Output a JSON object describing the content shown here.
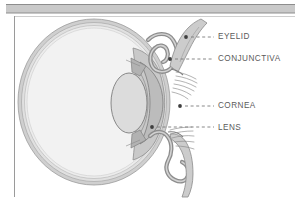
{
  "figure": {
    "background_color": "#ffffff",
    "frame": {
      "top_band_color": "#c9c9c9",
      "top_band_rule_color": "#8f8f8f",
      "left_rule_color": "#9a9a9a"
    }
  },
  "palette": {
    "outline": "#6e6e6e",
    "sclera_outer": "#bdbdbd",
    "sclera_mid": "#d6d6d6",
    "vitreous": "#f0f0f0",
    "cornea_fill": "#c4c4c4",
    "lens_fill": "#d9d9d9",
    "eyelid_fill": "#c0c0c0",
    "eyelid_skin": "#d0d0d0",
    "lash": "#8a8a8a",
    "leader": "#7a7a7a",
    "label_text": "#5b5b5b"
  },
  "labels": [
    {
      "id": "eyelid",
      "text": "EYELID",
      "x": 218,
      "y": 33,
      "dot": [
        186,
        37
      ],
      "leader_from": [
        191,
        37
      ],
      "leader_to": [
        214,
        37
      ]
    },
    {
      "id": "conjunctiva",
      "text": "CONJUNCTIVA",
      "x": 218,
      "y": 55,
      "dot": [
        170,
        59
      ],
      "leader_from": [
        175,
        59
      ],
      "leader_to": [
        214,
        59
      ]
    },
    {
      "id": "cornea",
      "text": "CORNEA",
      "x": 218,
      "y": 102,
      "dot": [
        180,
        106
      ],
      "leader_from": [
        185,
        106
      ],
      "leader_to": [
        214,
        106
      ]
    },
    {
      "id": "lens",
      "text": "LENS",
      "x": 218,
      "y": 124,
      "dot": [
        152,
        127
      ],
      "leader_from": [
        157,
        127
      ],
      "leader_to": [
        214,
        127
      ]
    }
  ],
  "structures": [
    {
      "id": "sclera",
      "name": "sclera-outer-ring"
    },
    {
      "id": "choroid",
      "name": "choroid-ring"
    },
    {
      "id": "retina",
      "name": "retina-ring"
    },
    {
      "id": "vitreous-body",
      "name": "vitreous-chamber"
    },
    {
      "id": "cornea",
      "name": "cornea"
    },
    {
      "id": "anterior-chamber",
      "name": "anterior-chamber"
    },
    {
      "id": "lens",
      "name": "lens"
    },
    {
      "id": "iris-upper",
      "name": "iris-upper"
    },
    {
      "id": "iris-lower",
      "name": "iris-lower"
    },
    {
      "id": "eyelid-upper",
      "name": "upper-eyelid"
    },
    {
      "id": "eyelid-lower",
      "name": "lower-eyelid"
    },
    {
      "id": "conjunctiva-upper",
      "name": "upper-conjunctival-fornix"
    },
    {
      "id": "conjunctiva-lower",
      "name": "lower-conjunctival-fornix"
    },
    {
      "id": "eyelashes-upper",
      "name": "upper-eyelashes"
    },
    {
      "id": "eyelashes-lower",
      "name": "lower-eyelashes"
    }
  ]
}
